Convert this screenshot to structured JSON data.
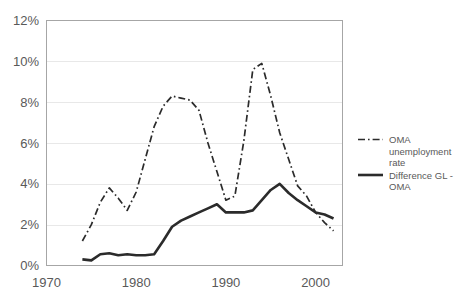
{
  "chart_data": {
    "type": "line",
    "title": "",
    "subtitle": "",
    "xlabel": "",
    "ylabel": "",
    "xlim": [
      1970,
      2003
    ],
    "ylim": [
      0,
      12
    ],
    "grid": true,
    "grid_axis": "y",
    "legend_position": "right",
    "y_tick_labels": [
      "12%",
      "10%",
      "8%",
      "6%",
      "4%",
      "2%",
      "0%"
    ],
    "y_tick_values": [
      12,
      10,
      8,
      6,
      4,
      2,
      0
    ],
    "x_tick_labels": [
      "1970",
      "1980",
      "1990",
      "2000"
    ],
    "x_tick_values": [
      1970,
      1980,
      1990,
      2000
    ],
    "x": [
      1974,
      1975,
      1976,
      1977,
      1978,
      1979,
      1980,
      1981,
      1982,
      1983,
      1984,
      1985,
      1986,
      1987,
      1988,
      1989,
      1990,
      1991,
      1992,
      1993,
      1994,
      1995,
      1996,
      1997,
      1998,
      1999,
      2000,
      2001,
      2002
    ],
    "series": [
      {
        "name": "OMA unemployment rate",
        "style": "dash-dot",
        "color": "#2b2b2b",
        "values": [
          1.2,
          2.0,
          3.1,
          3.8,
          3.3,
          2.7,
          3.6,
          5.2,
          6.8,
          7.8,
          8.3,
          8.2,
          8.1,
          7.6,
          6.0,
          4.6,
          3.2,
          3.4,
          6.1,
          9.6,
          9.9,
          8.3,
          6.5,
          5.2,
          3.9,
          3.4,
          2.6,
          2.1,
          1.7
        ]
      },
      {
        "name": "Difference GL - OMA",
        "style": "solid",
        "color": "#2b2b2b",
        "values": [
          0.3,
          0.25,
          0.55,
          0.6,
          0.5,
          0.55,
          0.5,
          0.5,
          0.55,
          1.2,
          1.9,
          2.2,
          2.4,
          2.6,
          2.8,
          3.0,
          2.6,
          2.6,
          2.6,
          2.7,
          3.2,
          3.7,
          4.0,
          3.55,
          3.2,
          2.9,
          2.6,
          2.5,
          2.3
        ]
      }
    ]
  },
  "legend": {
    "items": [
      {
        "label_line1": "OMA",
        "label_line2": "unemployment",
        "label_line3": "rate",
        "style": "dash-dot"
      },
      {
        "label_line1": "Difference GL -",
        "label_line2": "OMA",
        "style": "solid"
      }
    ]
  },
  "colors": {
    "line": "#2b2b2b",
    "grid": "#e8e8e8",
    "border": "#a6a6a6",
    "text": "#595959",
    "background": "#ffffff"
  }
}
